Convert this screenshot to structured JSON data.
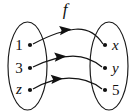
{
  "figure": {
    "kind": "function-mapping-diagram",
    "width": 132,
    "height": 111,
    "background_color": "#ffffff",
    "ink_color": "#111111",
    "function_label": "f",
    "domain_set": {
      "name": "domain-oval",
      "shape": "ellipse",
      "center_x": 27.5,
      "center_y": 66,
      "radius_x": 19.5,
      "radius_y": 44,
      "elements": [
        {
          "label": "1",
          "italic": false,
          "label_x": 19,
          "label_y": 50,
          "dot_x": 30,
          "dot_y": 45
        },
        {
          "label": "3",
          "italic": false,
          "label_x": 19,
          "label_y": 73,
          "dot_x": 30,
          "dot_y": 68
        },
        {
          "label": "z",
          "italic": true,
          "label_x": 19,
          "label_y": 94,
          "dot_x": 30,
          "dot_y": 90
        }
      ]
    },
    "codomain_set": {
      "name": "codomain-oval",
      "shape": "ellipse",
      "center_x": 109,
      "center_y": 66,
      "radius_x": 19,
      "radius_y": 44,
      "elements": [
        {
          "label": "x",
          "italic": true,
          "label_x": 112,
          "label_y": 50,
          "dot_x": 105,
          "dot_y": 45
        },
        {
          "label": "y",
          "italic": true,
          "label_x": 112,
          "label_y": 73,
          "dot_x": 105,
          "dot_y": 68
        },
        {
          "label": "5",
          "italic": false,
          "label_x": 112,
          "label_y": 95,
          "dot_x": 105,
          "dot_y": 90
        }
      ]
    },
    "mappings": [
      {
        "name": "mapping-1-to-x",
        "from": "1",
        "to": "x",
        "path": "M33,44 C48,36 62,30 78,29 C90,29 98,36 103,44",
        "arrow_tip_x": 71.5,
        "arrow_tip_y": 29.3,
        "arrow_angle_deg": -6
      },
      {
        "name": "mapping-3-to-y",
        "from": "3",
        "to": "y",
        "path": "M33,67 C45,61 58,56 73,56 C86,56 95,61 102,67",
        "arrow_tip_x": 66.5,
        "arrow_tip_y": 56.2,
        "arrow_angle_deg": -4
      },
      {
        "name": "mapping-z-to-5",
        "from": "z",
        "to": "5",
        "path": "M33,89 C43,83 55,78 69,78 C84,78 95,83 102,89",
        "arrow_tip_x": 63,
        "arrow_tip_y": 78.4,
        "arrow_angle_deg": -5
      }
    ],
    "function_label_position": {
      "x": 65,
      "y": 15
    },
    "notation": "f : {1, 3, z} → {x, y, 5}"
  }
}
